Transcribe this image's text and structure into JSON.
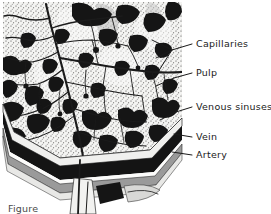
{
  "figure": {
    "kind": "anatomical-histology-diagram",
    "background_color": "#ffffff",
    "ink_color": "#151515",
    "pulp_fill_color": "#f2f2f0",
    "stipple_color": "#3a3a3a",
    "vein_band_color": "#141414",
    "artery_band_color": "#8c8c8c",
    "labels": [
      {
        "id": "capillaries",
        "text": "Capillaries",
        "x": 196,
        "y": 47,
        "leader_from_x": 192,
        "leader_from_y": 44,
        "leader_to_x": 150,
        "leader_to_y": 55
      },
      {
        "id": "pulp",
        "text": "Pulp",
        "x": 196,
        "y": 76,
        "leader_from_x": 192,
        "leader_from_y": 73,
        "leader_to_x": 156,
        "leader_to_y": 83
      },
      {
        "id": "venous-sinuses",
        "text": "Venous sinuses",
        "x": 196,
        "y": 110,
        "leader_from_x": 192,
        "leader_from_y": 107,
        "leader_to_x": 160,
        "leader_to_y": 118
      },
      {
        "id": "vein",
        "text": "Vein",
        "x": 196,
        "y": 140,
        "leader_from_x": 192,
        "leader_from_y": 137,
        "leader_to_x": 172,
        "leader_to_y": 137
      },
      {
        "id": "artery",
        "text": "Artery",
        "x": 196,
        "y": 158,
        "leader_from_x": 192,
        "leader_from_y": 155,
        "leader_to_x": 170,
        "leader_to_y": 155
      }
    ],
    "caption": {
      "text": "Figure",
      "x": 8,
      "y": 212,
      "note": "caption cropped at bottom edge"
    }
  }
}
